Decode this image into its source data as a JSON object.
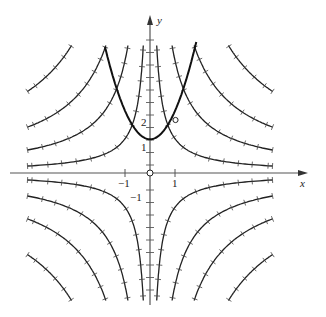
{
  "diagram": {
    "type": "solution-curves-with-direction-field",
    "axes": {
      "x_label": "x",
      "y_label": "y",
      "x_ticks": [
        {
          "value": -1,
          "label": "−1"
        },
        {
          "value": 1,
          "label": "1"
        }
      ],
      "y_ticks": [
        {
          "value": -1,
          "label": "−1"
        },
        {
          "value": 1,
          "label": "1"
        },
        {
          "value": 2,
          "label": "2"
        }
      ]
    },
    "hyperbola_family": {
      "equation": "xy = c",
      "c_values": [
        1.37,
        4.5,
        9,
        16
      ],
      "quadrants": [
        "I",
        "II",
        "III",
        "IV"
      ],
      "x_extent": 4.9,
      "y_extent": 5.1
    },
    "highlight_curve": {
      "description": "parabola-shaped thick curve",
      "vertex": [
        0,
        1.35
      ],
      "x_range": [
        -1.8,
        1.85
      ]
    },
    "marked_points": [
      {
        "x": 1,
        "y": 2.1,
        "style": "open-circle"
      },
      {
        "x": 0,
        "y": 0,
        "style": "open-circle"
      }
    ],
    "colors": {
      "ink": "#222222",
      "axis": "#555555",
      "background": "#ffffff"
    }
  }
}
